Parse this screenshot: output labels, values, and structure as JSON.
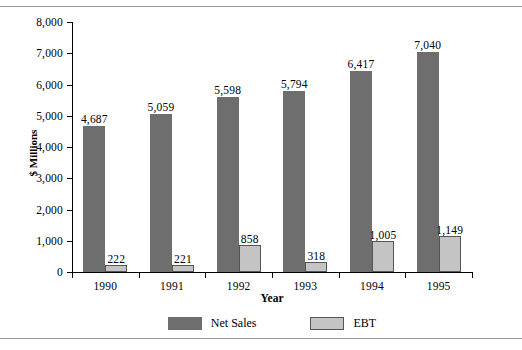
{
  "chart_data": {
    "type": "bar",
    "title": "",
    "xlabel": "Year",
    "ylabel": "$ Millions",
    "categories": [
      "1990",
      "1991",
      "1992",
      "1993",
      "1994",
      "1995"
    ],
    "series": [
      {
        "name": "Net Sales",
        "color": "#6e6e6e",
        "values": [
          4687,
          5059,
          5598,
          5794,
          6417,
          7040
        ],
        "labels": [
          "4,687",
          "5,059",
          "5,598",
          "5,794",
          "6,417",
          "7,040"
        ]
      },
      {
        "name": "EBT",
        "color": "#c4c4c4",
        "values": [
          222,
          221,
          858,
          318,
          1005,
          1149
        ],
        "labels": [
          "222",
          "221",
          "858",
          "318",
          "1,005",
          "1,149"
        ]
      }
    ],
    "ylim": [
      0,
      8000
    ],
    "yticks": [
      0,
      1000,
      2000,
      3000,
      4000,
      5000,
      6000,
      7000,
      8000
    ],
    "ytick_labels": [
      "0",
      "1,000",
      "2,000",
      "3,000",
      "4,000",
      "5,000",
      "6,000",
      "7,000",
      "8,000"
    ],
    "grid": false,
    "legend_position": "bottom-center",
    "data_labels": true
  }
}
